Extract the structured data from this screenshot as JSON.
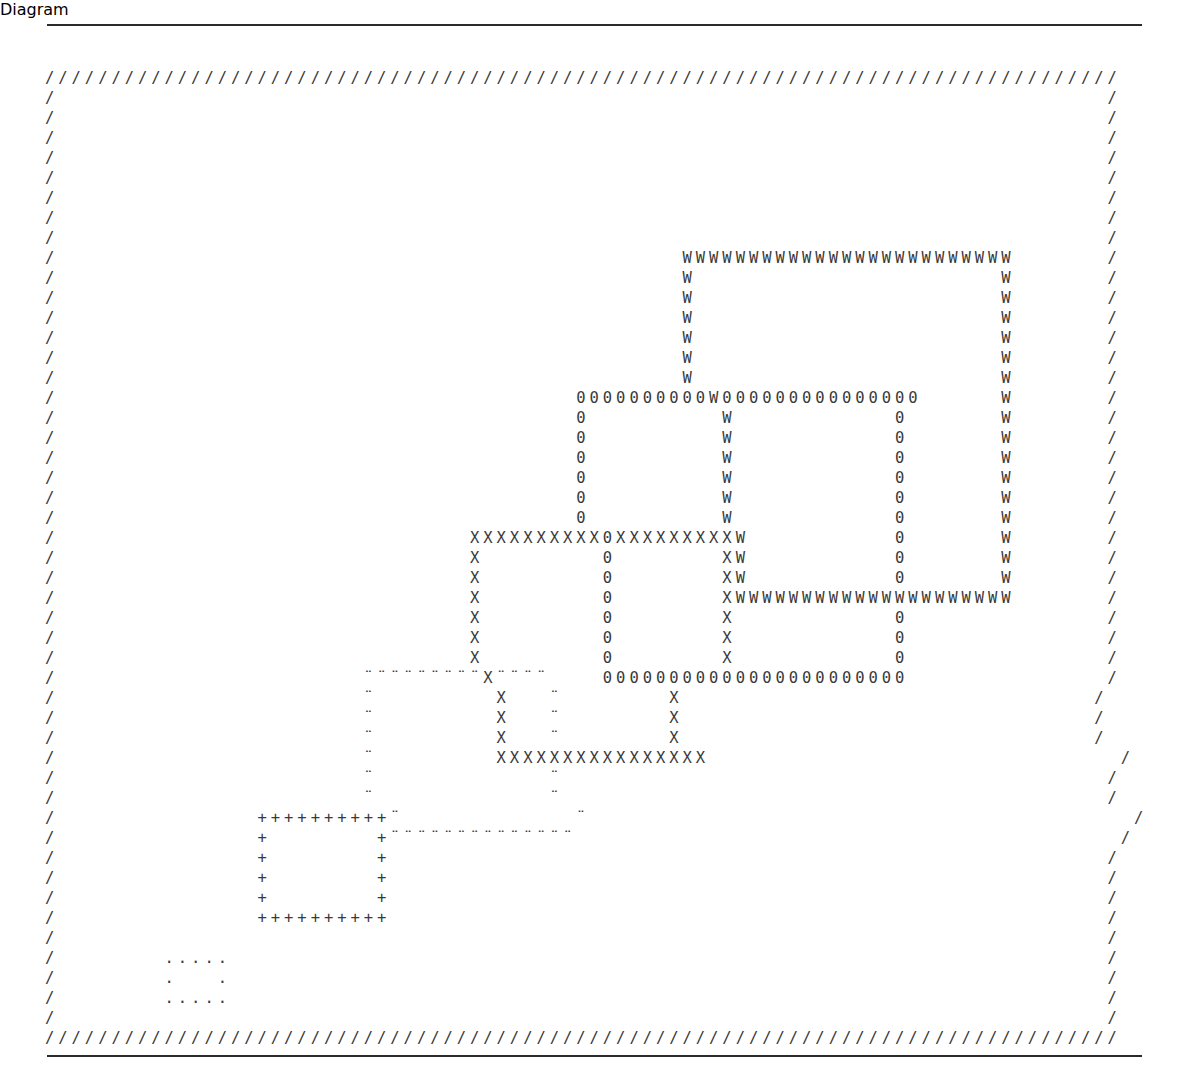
{
  "page": {
    "background_color": "#ffffff",
    "ink_color": "#3a3a3a",
    "rule_color": "#2b2b2b"
  },
  "rules": {
    "top_label": "top horizontal rule",
    "bottom_label": "bottom horizontal rule"
  },
  "art": {
    "description": "Six nested / overlapping rectangles drawn in ASCII, each outlined with a different character, enclosed in a slash border.",
    "char_legend": [
      {
        "name": "border",
        "char": "/",
        "note": "outer frame"
      },
      {
        "name": "rect-w",
        "char": "W",
        "note": "largest, upper right"
      },
      {
        "name": "rect-zero",
        "char": "0",
        "note": "second, overlaps W"
      },
      {
        "name": "rect-x",
        "char": "X",
        "note": "third, overlaps 0"
      },
      {
        "name": "rect-colon",
        "char": "¨",
        "note": "fourth, small-dot glyph"
      },
      {
        "name": "rect-plus",
        "char": "+",
        "note": "fifth, lower left"
      },
      {
        "name": "rect-dot",
        "char": ".",
        "note": "smallest, bottom left"
      }
    ],
    "grid": {
      "columns": 82,
      "rows": 49,
      "char_width_px": 13.4,
      "row_height_px": 20
    },
    "lines": [
      "/////////////////////////////////////////////////////////////////////////////////",
      "/                                                                               /",
      "/                                                                               /",
      "/                                                                               /",
      "/                                                                               /",
      "/                                                                               /",
      "/                                                                               /",
      "/                                                                               /",
      "/                                                                               /",
      "/                                               WWWWWWWWWWWWWWWWWWWWWWWWW       /",
      "/                                               W                       W       /",
      "/                                               W                       W       /",
      "/                                               W                       W       /",
      "/                                               W                       W       /",
      "/                                               W                       W       /",
      "/                                               W                       W       /",
      "/                                       0000000000W000000000000000      W       /",
      "/                                       0          W            0       W       /",
      "/                                       0          W            0       W       /",
      "/                                       0          W            0       W       /",
      "/                                       0          W            0       W       /",
      "/                                       0          W            0       W       /",
      "/                                       0          W            0       W       /",
      "/                               XXXXXXXXXX0XXXXXXXXXW           0       W       /",
      "/                               X         0        XW           0       W       /",
      "/                               X         0        XW           0       W       /",
      "/                               X         0        XWWWWWWWWWWWWWWWWWWWWW       /",
      "/                               X         0        X            0               /",
      "/                               X         0        X            0               /",
      "/                               X         0        X            0               /",
      "/                       ¨¨¨¨¨¨¨¨¨X¨¨¨¨    00000000000000000000000               /",
      "/                       ¨         X   ¨        X                               /",
      "/                       ¨         X   ¨        X                               /",
      "/                       ¨         X   ¨        X                               /",
      "/                       ¨         XXXXXXXXXXXXXXXX                               /",
      "/                       ¨             ¨                                         /",
      "/                       ¨             ¨                                         /",
      "/               ++++++++++¨             ¨                                         /",
      "/               +        +¨¨¨¨¨¨¨¨¨¨¨¨¨¨                                         /",
      "/               +        +                                                      /",
      "/               +        +                                                      /",
      "/               +        +                                                      /",
      "/               ++++++++++                                                      /",
      "/                                                                               /",
      "/        .....                                                                  /",
      "/        .   .                                                                  /",
      "/        .....                                                                  /",
      "/                                                                               /",
      "/////////////////////////////////////////////////////////////////////////////////"
    ]
  }
}
